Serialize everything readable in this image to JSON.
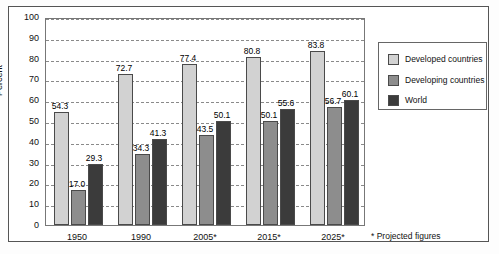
{
  "chart_data": {
    "type": "bar",
    "title": "",
    "subtitle": "",
    "xlabel": "",
    "ylabel": "Percent",
    "ylim": [
      0,
      100
    ],
    "ytick_step": 10,
    "ytick_labels": [
      "100",
      "90",
      "80",
      "70",
      "60",
      "50",
      "40",
      "30",
      "20",
      "10",
      "0"
    ],
    "grid": true,
    "grid_axis": "y",
    "grid_style": "dashed",
    "legend_position": "right",
    "categories": [
      "1950",
      "1990",
      "2005*",
      "2015*",
      "2025*"
    ],
    "series": [
      {
        "name": "Developed countries",
        "color": "#d2d2d2",
        "values": [
          54.3,
          72.7,
          77.4,
          80.8,
          83.8
        ],
        "labels": [
          "54.3",
          "72.7",
          "77.4",
          "80.8",
          "83.8"
        ]
      },
      {
        "name": "Developing countries",
        "color": "#8d8d8d",
        "values": [
          17.0,
          34.3,
          43.5,
          50.1,
          56.7
        ],
        "labels": [
          "17.0",
          "34.3",
          "43.5",
          "50.1",
          "56.7"
        ]
      },
      {
        "name": "World",
        "color": "#3b3b3b",
        "values": [
          29.3,
          41.3,
          50.1,
          55.6,
          60.1
        ],
        "labels": [
          "29.3",
          "41.3",
          "50.1",
          "55.6",
          "60.1"
        ]
      }
    ],
    "annotations": [
      "* Projected figures"
    ]
  },
  "axes": {
    "ylabel": "Percent",
    "yticks": [
      "100",
      "90",
      "80",
      "70",
      "60",
      "50",
      "40",
      "30",
      "20",
      "10",
      "0"
    ],
    "xticks": [
      "1950",
      "1990",
      "2005*",
      "2015*",
      "2025*"
    ]
  },
  "legend": {
    "items": [
      {
        "label": "Developed countries",
        "swatch": "legend-swatch-developed"
      },
      {
        "label": "Developing countries",
        "swatch": "legend-swatch-developing"
      },
      {
        "label": "World",
        "swatch": "legend-swatch-world"
      }
    ]
  },
  "footnote": {
    "text": "* Projected figures"
  },
  "values": {
    "g0": {
      "developed": "54.3",
      "developing": "17.0",
      "world": "29.3"
    },
    "g1": {
      "developed": "72.7",
      "developing": "34.3",
      "world": "41.3"
    },
    "g2": {
      "developed": "77.4",
      "developing": "43.5",
      "world": "50.1"
    },
    "g3": {
      "developed": "80.8",
      "developing": "50.1",
      "world": "55.6"
    },
    "g4": {
      "developed": "83.8",
      "developing": "56.7",
      "world": "60.1"
    }
  }
}
